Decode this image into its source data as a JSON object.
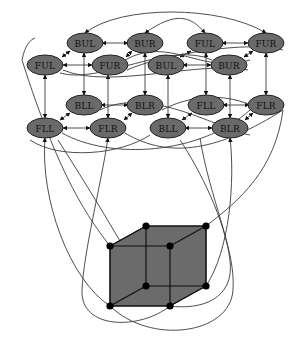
{
  "diagram": {
    "type": "directed-graph-over-cube",
    "node_fill": "#6a6a6a",
    "edge_color": "#3a3a3a",
    "cube_fill": "#6b6b6b",
    "nodes": [
      {
        "id": "n0",
        "label": "FUL",
        "x": 45,
        "y": 65
      },
      {
        "id": "n1",
        "label": "BUL",
        "x": 85,
        "y": 43
      },
      {
        "id": "n2",
        "label": "FUR",
        "x": 110,
        "y": 65
      },
      {
        "id": "n3",
        "label": "BUR",
        "x": 145,
        "y": 43
      },
      {
        "id": "n4",
        "label": "FUL",
        "x": 205,
        "y": 43
      },
      {
        "id": "n5",
        "label": "FUR",
        "x": 266,
        "y": 43
      },
      {
        "id": "n6",
        "label": "BUL",
        "x": 166,
        "y": 65
      },
      {
        "id": "n7",
        "label": "BUR",
        "x": 229,
        "y": 65
      },
      {
        "id": "n8",
        "label": "BLL",
        "x": 84,
        "y": 105
      },
      {
        "id": "n9",
        "label": "BLR",
        "x": 145,
        "y": 105
      },
      {
        "id": "n10",
        "label": "FLL",
        "x": 206,
        "y": 105
      },
      {
        "id": "n11",
        "label": "FLR",
        "x": 266,
        "y": 105
      },
      {
        "id": "n12",
        "label": "FLL",
        "x": 45,
        "y": 128
      },
      {
        "id": "n13",
        "label": "FLR",
        "x": 108,
        "y": 128
      },
      {
        "id": "n14",
        "label": "BLL",
        "x": 168,
        "y": 128
      },
      {
        "id": "n15",
        "label": "BLR",
        "x": 230,
        "y": 128
      }
    ],
    "cube": {
      "vertices": [
        {
          "name": "front-top-left",
          "x": 110,
          "y": 246
        },
        {
          "name": "front-top-right",
          "x": 170,
          "y": 246
        },
        {
          "name": "back-top-left",
          "x": 146,
          "y": 226
        },
        {
          "name": "back-top-right",
          "x": 206,
          "y": 226
        },
        {
          "name": "front-bottom-left",
          "x": 110,
          "y": 306
        },
        {
          "name": "front-bottom-right",
          "x": 170,
          "y": 306
        },
        {
          "name": "back-bottom-left",
          "x": 146,
          "y": 286
        },
        {
          "name": "back-bottom-right",
          "x": 206,
          "y": 286
        }
      ]
    }
  }
}
